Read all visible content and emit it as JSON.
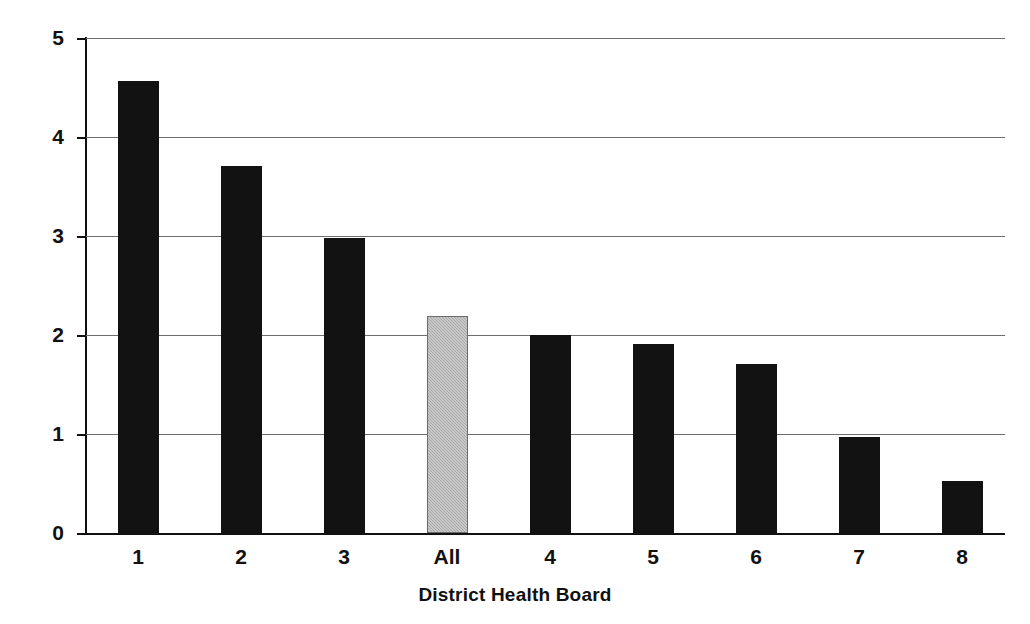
{
  "chart_data": {
    "type": "bar",
    "title": "",
    "subtitle": "",
    "xlabel": "District Health Board",
    "ylabel": "Average HoNOS improvement",
    "categories": [
      "1",
      "2",
      "3",
      "All",
      "4",
      "5",
      "6",
      "7",
      "8"
    ],
    "values": [
      4.57,
      3.71,
      2.98,
      2.19,
      2.0,
      1.91,
      1.71,
      0.97,
      0.53
    ],
    "series": [
      {
        "name": "Average HoNOS improvement",
        "values": [
          4.57,
          3.71,
          2.98,
          2.19,
          2.0,
          1.91,
          1.71,
          0.97,
          0.53
        ]
      }
    ],
    "bar_styles": [
      "dark",
      "dark",
      "dark",
      "light",
      "dark",
      "dark",
      "dark",
      "dark",
      "dark"
    ],
    "colors": {
      "bar_dark": "#121212",
      "bar_light": "#a9a9a9",
      "gridline": "#6d6d6d",
      "axis": "#111111",
      "background": "#ffffff"
    },
    "ylim": [
      0,
      5
    ],
    "ytick_values": [
      0,
      1,
      2,
      3,
      4,
      5
    ],
    "ytick_labels": [
      "0",
      "1",
      "2",
      "3",
      "4",
      "5"
    ],
    "grid": true,
    "grid_axis": "y",
    "legend": false,
    "legend_position": "none",
    "annotations": []
  }
}
